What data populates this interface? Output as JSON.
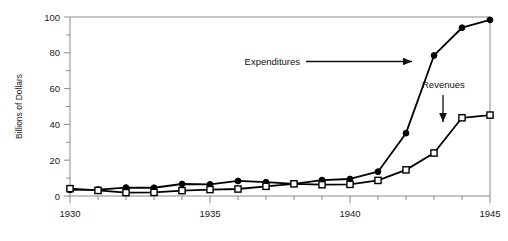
{
  "chart_data": {
    "type": "line",
    "title": "",
    "xlabel": "",
    "ylabel": "Billions of Dollars",
    "xlim": [
      1930,
      1945
    ],
    "ylim": [
      0,
      100
    ],
    "grid": false,
    "legend_position": "inline-annotations",
    "x": [
      1930,
      1931,
      1932,
      1933,
      1934,
      1935,
      1936,
      1937,
      1938,
      1939,
      1940,
      1941,
      1942,
      1943,
      1944,
      1945
    ],
    "series": [
      {
        "name": "Expenditures",
        "marker": "filled-circle",
        "values": [
          3.4,
          3.6,
          4.7,
          4.6,
          6.7,
          6.5,
          8.4,
          7.7,
          6.8,
          8.9,
          9.5,
          13.6,
          35.1,
          78.5,
          94.0,
          98.4
        ]
      },
      {
        "name": "Revenues",
        "marker": "open-square",
        "values": [
          4.1,
          3.1,
          1.9,
          2.0,
          3.0,
          3.6,
          3.9,
          5.4,
          6.8,
          6.3,
          6.5,
          8.7,
          14.6,
          24.0,
          43.7,
          45.2
        ]
      }
    ],
    "y_ticks_major": [
      0,
      20,
      40,
      60,
      80,
      100
    ],
    "y_ticks_minor": [
      10,
      30,
      50,
      70,
      90
    ],
    "x_ticks_major": [
      1930,
      1935,
      1940,
      1945
    ],
    "x_ticks_minor": [
      1931,
      1932,
      1933,
      1934,
      1936,
      1937,
      1938,
      1939,
      1941,
      1942,
      1943,
      1944
    ],
    "annotations": [
      {
        "text": "Expenditures",
        "arrow": "right",
        "points_to_series": "Expenditures",
        "points_to_x": 1943
      },
      {
        "text": "Revenues",
        "arrow": "down",
        "points_to_series": "Revenues",
        "points_to_x": 1944
      }
    ],
    "colors": {
      "line": "#000000",
      "marker_fill_expenditures": "#000000",
      "marker_fill_revenues": "#ffffff",
      "axis": "#8a8a8a",
      "text": "#1a1a1a"
    }
  },
  "axis_text": {
    "ylabel": "Billions of Dollars",
    "y_tick_labels": [
      "100",
      "80",
      "60",
      "40",
      "20",
      "0"
    ],
    "x_tick_labels": [
      "1930",
      "1935",
      "1940",
      "1945"
    ]
  },
  "annotation_text": {
    "expenditures": "Expenditures",
    "revenues": "Revenues"
  }
}
